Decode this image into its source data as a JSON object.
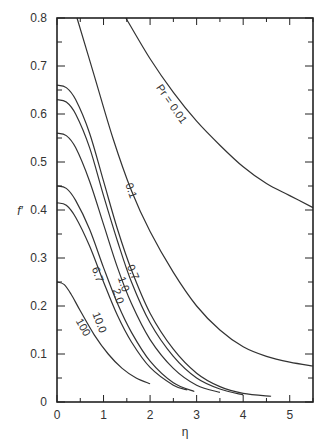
{
  "chart_data": {
    "type": "line",
    "title": "",
    "xlabel": "η",
    "ylabel": "f′",
    "xlim": [
      0,
      5.5
    ],
    "ylim": [
      0,
      0.8
    ],
    "xticks": [
      0,
      1,
      2,
      3,
      4,
      5
    ],
    "xtick_labels": [
      "0",
      "1",
      "2",
      "3",
      "4",
      "5"
    ],
    "yticks": [
      0,
      0.1,
      0.2,
      0.3,
      0.4,
      0.5,
      0.6,
      0.7,
      0.8
    ],
    "ytick_labels": [
      "0",
      "0.1",
      "0.2",
      "0.3",
      "0.4",
      "0.5",
      "0.6",
      "0.7",
      "0.8"
    ],
    "grid": false,
    "legend": "inline labels on curves",
    "series": [
      {
        "name": "Pr = 0.01",
        "label": "Pr = 0.01",
        "x": [
          1.48,
          2.0,
          2.5,
          3.0,
          3.5,
          4.0,
          4.5,
          5.0,
          5.5
        ],
        "y": [
          0.8,
          0.715,
          0.645,
          0.585,
          0.535,
          0.49,
          0.455,
          0.43,
          0.405
        ],
        "label_at": [
          2.45,
          0.62
        ]
      },
      {
        "name": "0.1",
        "label": "0.1",
        "x": [
          0.43,
          0.8,
          1.2,
          1.6,
          2.0,
          2.5,
          3.0,
          3.5,
          4.0,
          4.5,
          5.0,
          5.5
        ],
        "y": [
          0.8,
          0.68,
          0.55,
          0.44,
          0.355,
          0.27,
          0.2,
          0.15,
          0.115,
          0.095,
          0.083,
          0.075
        ],
        "label_at": [
          1.58,
          0.44
        ]
      },
      {
        "name": "0.7",
        "label": "0.7",
        "x": [
          0.0,
          0.2,
          0.4,
          0.7,
          1.0,
          1.3,
          1.6,
          2.0,
          2.5,
          3.0,
          3.5,
          4.0,
          4.6
        ],
        "y": [
          0.66,
          0.655,
          0.63,
          0.56,
          0.46,
          0.36,
          0.275,
          0.185,
          0.11,
          0.06,
          0.032,
          0.018,
          0.012
        ],
        "label_at": [
          1.62,
          0.27
        ]
      },
      {
        "name": "1.0",
        "label": "1.0",
        "x": [
          0.0,
          0.2,
          0.4,
          0.7,
          1.0,
          1.3,
          1.6,
          2.0,
          2.5,
          3.0,
          3.5,
          4.0
        ],
        "y": [
          0.63,
          0.625,
          0.6,
          0.53,
          0.43,
          0.335,
          0.25,
          0.165,
          0.095,
          0.05,
          0.027,
          0.015
        ],
        "label_at": [
          1.42,
          0.245
        ]
      },
      {
        "name": "2.0",
        "label": "2.0",
        "x": [
          0.0,
          0.2,
          0.4,
          0.7,
          1.0,
          1.3,
          1.6,
          2.0,
          2.5,
          3.0,
          3.5
        ],
        "y": [
          0.56,
          0.555,
          0.53,
          0.46,
          0.37,
          0.28,
          0.205,
          0.13,
          0.07,
          0.035,
          0.02
        ],
        "label_at": [
          1.3,
          0.22
        ]
      },
      {
        "name": "6.7",
        "label": "6.7",
        "x": [
          0.0,
          0.2,
          0.4,
          0.7,
          1.0,
          1.3,
          1.6,
          2.0,
          2.5,
          2.95
        ],
        "y": [
          0.45,
          0.445,
          0.42,
          0.36,
          0.28,
          0.205,
          0.145,
          0.085,
          0.04,
          0.022
        ],
        "label_at": [
          0.86,
          0.265
        ]
      },
      {
        "name": "10.0",
        "label": "10.0",
        "x": [
          0.0,
          0.2,
          0.4,
          0.7,
          1.0,
          1.3,
          1.6,
          2.0,
          2.5,
          2.8
        ],
        "y": [
          0.415,
          0.41,
          0.385,
          0.325,
          0.25,
          0.18,
          0.125,
          0.072,
          0.035,
          0.025
        ],
        "label_at": [
          0.9,
          0.165
        ]
      },
      {
        "name": "100",
        "label": "100",
        "x": [
          0.0,
          0.15,
          0.3,
          0.5,
          0.8,
          1.1,
          1.4,
          1.7,
          2.0
        ],
        "y": [
          0.25,
          0.245,
          0.225,
          0.19,
          0.14,
          0.1,
          0.07,
          0.05,
          0.038
        ],
        "label_at": [
          0.55,
          0.155
        ]
      }
    ]
  },
  "style": {
    "line_color": "#333333",
    "axis_color": "#222222",
    "background": "#ffffff"
  }
}
